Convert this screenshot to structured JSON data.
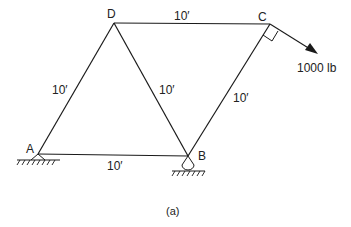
{
  "figure": {
    "caption": "(a)",
    "nodes": {
      "A": "A",
      "B": "B",
      "C": "C",
      "D": "D"
    },
    "members": {
      "DC": "10′",
      "AD": "10′",
      "DB": "10′",
      "BC": "10′",
      "AB": "10′"
    },
    "load": {
      "label": "1000 lb"
    },
    "colors": {
      "line": "#1a1a1a",
      "text": "#222222"
    }
  }
}
